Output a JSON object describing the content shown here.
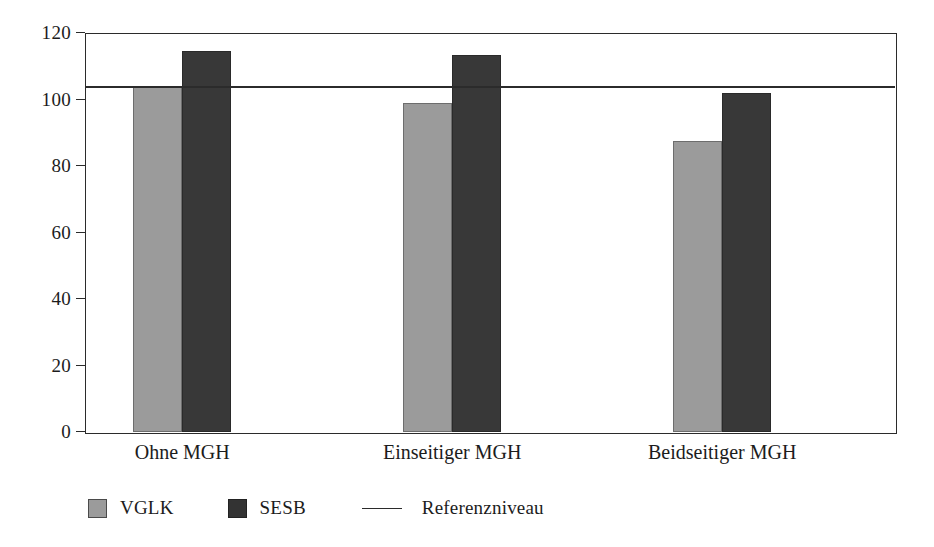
{
  "chart_data": {
    "type": "bar",
    "title": "",
    "subtitle": "",
    "xlabel": "",
    "ylabel": "",
    "categories": [
      "Ohne MGH",
      "Einseitiger MGH",
      "Beidseitiger MGH"
    ],
    "series": [
      {
        "name": "VGLK",
        "color": "#9b9b9b",
        "values": [
          104,
          99,
          87.5
        ]
      },
      {
        "name": "SESB",
        "color": "#383838",
        "values": [
          114.5,
          113.5,
          102
        ]
      }
    ],
    "reference_line": {
      "label": "Referenzniveau",
      "value": 104,
      "color": "#2b2b2b"
    },
    "ylim": [
      0,
      120
    ],
    "yticks": [
      0,
      20,
      40,
      60,
      80,
      100,
      120
    ],
    "ytick_labels": [
      "0",
      "20",
      "40",
      "60",
      "80",
      "100",
      "120"
    ],
    "grid": false,
    "legend_position": "bottom-left",
    "legend_entries": [
      "VGLK",
      "SESB",
      "Referenzniveau"
    ]
  },
  "axis": {
    "y_labels": [
      "120",
      "100",
      "80",
      "60",
      "40",
      "20",
      "0"
    ]
  },
  "legend": {
    "vglk_label": "VGLK",
    "sesb_label": "SESB",
    "reference_label": "Referenzniveau"
  },
  "categories": {
    "c0": "Ohne MGH",
    "c1": "Einseitiger MGH",
    "c2": "Beidseitiger MGH"
  }
}
